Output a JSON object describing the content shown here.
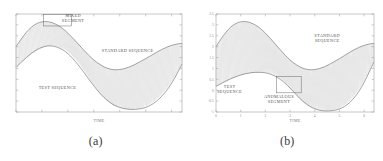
{
  "figure": {
    "panels": [
      {
        "id": "a",
        "caption": "(a)",
        "xlabel": "TIME",
        "annotations": {
          "mixed_segment": "MIXED\nSEGMENT",
          "mixed_segment_line1": "MIXED",
          "mixed_segment_line2": "SEGMENT",
          "standard_sequence": "STANDARD SEQUENCE",
          "test_sequence": "TEST SEQUENCE"
        }
      },
      {
        "id": "b",
        "caption": "(b)",
        "xlabel": "TIME",
        "annotations": {
          "standard_sequence_line1": "STANDARD",
          "standard_sequence_line2": "SEQUENCE",
          "test_sequence_line1": "TEST",
          "test_sequence_line2": "SEQUENCE",
          "anomalous_segment_line1": "ANOMALOUS",
          "anomalous_segment_line2": "SEGMENT"
        }
      }
    ]
  },
  "colors": {
    "background": "#ffffff",
    "axis": "#9a9a9a",
    "curve": "#6e6e6e",
    "connector": "#a8a8a8",
    "text": "#5a5a5a",
    "caption": "#3a3a3a"
  },
  "chart_data": [
    {
      "type": "line",
      "panel": "a",
      "title": "",
      "xlabel": "TIME",
      "ylabel": "",
      "grid": false,
      "legend": "none",
      "xlim": [
        0,
        6.4
      ],
      "ylim": [
        -1.0,
        3.5
      ],
      "xticks": [
        0,
        1,
        2,
        3,
        4,
        5,
        6
      ],
      "xticklabels": [
        "",
        "",
        "",
        "",
        "",
        "",
        ""
      ],
      "yticks": [
        -1,
        -0.5,
        0,
        0.5,
        1,
        1.5,
        2,
        2.5,
        3,
        3.5
      ],
      "yticklabels": [
        "",
        "",
        "",
        "",
        "",
        "",
        "",
        "",
        "",
        ""
      ],
      "description": "Dynamic time warping alignment between a standard sequence and a test sequence; dense vertical connector lines join corresponding points. A boxed region near the first peak marks the MIXED SEGMENT.",
      "series": [
        {
          "name": "STANDARD SEQUENCE",
          "x": [
            0.0,
            0.2,
            0.4,
            0.6,
            0.8,
            1.0,
            1.2,
            1.4,
            1.6,
            1.8,
            2.0,
            2.2,
            2.4,
            2.6,
            2.8,
            3.0,
            3.2,
            3.4,
            3.6,
            3.8,
            4.0,
            4.2,
            4.4,
            4.6,
            4.8,
            5.0,
            5.2,
            5.4,
            5.6,
            5.8,
            6.0,
            6.2,
            6.4
          ],
          "values": [
            2.0,
            2.35,
            2.66,
            2.9,
            3.06,
            3.14,
            3.15,
            3.1,
            2.99,
            2.83,
            2.62,
            2.38,
            2.12,
            1.86,
            1.61,
            1.39,
            1.21,
            1.07,
            0.98,
            0.94,
            0.95,
            1.0,
            1.08,
            1.19,
            1.32,
            1.45,
            1.59,
            1.73,
            1.86,
            1.97,
            2.06,
            2.12,
            2.15
          ]
        },
        {
          "name": "TEST SEQUENCE",
          "x": [
            0.0,
            0.2,
            0.4,
            0.6,
            0.8,
            1.0,
            1.2,
            1.4,
            1.6,
            1.8,
            2.0,
            2.2,
            2.4,
            2.6,
            2.8,
            3.0,
            3.2,
            3.4,
            3.6,
            3.8,
            4.0,
            4.2,
            4.4,
            4.6,
            4.8,
            5.0,
            5.2,
            5.4,
            5.6,
            5.8,
            6.0,
            6.2,
            6.4
          ],
          "values": [
            1.05,
            1.28,
            1.5,
            1.7,
            1.86,
            1.97,
            2.03,
            2.03,
            1.97,
            1.86,
            1.68,
            1.44,
            1.16,
            0.85,
            0.52,
            0.2,
            -0.09,
            -0.34,
            -0.54,
            -0.69,
            -0.79,
            -0.85,
            -0.88,
            -0.88,
            -0.85,
            -0.79,
            -0.68,
            -0.52,
            -0.3,
            -0.02,
            0.32,
            0.74,
            1.2
          ]
        }
      ],
      "annotations": [
        {
          "text": "MIXED SEGMENT",
          "x": 2.2,
          "y": 3.35,
          "boxed": true
        },
        {
          "text": "STANDARD SEQUENCE",
          "x": 4.3,
          "y": 1.75,
          "boxed": false
        },
        {
          "text": "TEST SEQUENCE",
          "x": 1.6,
          "y": 0.05,
          "boxed": false
        }
      ]
    },
    {
      "type": "line",
      "panel": "b",
      "title": "",
      "xlabel": "TIME",
      "ylabel": "",
      "grid": false,
      "legend": "none",
      "xlim": [
        0,
        6.4
      ],
      "ylim": [
        -1.0,
        3.5
      ],
      "xticks": [
        0,
        1,
        2,
        3,
        4,
        5,
        6
      ],
      "xticklabels": [
        "0",
        "1",
        "2",
        "3",
        "4",
        "5",
        "6"
      ],
      "yticks": [
        -1,
        -0.5,
        0,
        0.5,
        1,
        1.5,
        2,
        2.5,
        3,
        3.5
      ],
      "yticklabels": [
        "-1",
        "-0.5",
        "0",
        "0.5",
        "1",
        "1.5",
        "2",
        "2.5",
        "3",
        "3.5"
      ],
      "description": "Dynamic time warping alignment between a standard sequence and a test sequence; dense vertical connector lines join corresponding points. A boxed region near x=3 marks the ANOMALOUS SEGMENT.",
      "series": [
        {
          "name": "STANDARD SEQUENCE",
          "x": [
            0.0,
            0.2,
            0.4,
            0.6,
            0.8,
            1.0,
            1.2,
            1.4,
            1.6,
            1.8,
            2.0,
            2.2,
            2.4,
            2.6,
            2.8,
            3.0,
            3.2,
            3.4,
            3.6,
            3.8,
            4.0,
            4.2,
            4.4,
            4.6,
            4.8,
            5.0,
            5.2,
            5.4,
            5.6,
            5.8,
            6.0,
            6.2,
            6.4
          ],
          "values": [
            2.0,
            2.35,
            2.66,
            2.9,
            3.06,
            3.14,
            3.15,
            3.1,
            2.99,
            2.83,
            2.62,
            2.38,
            2.12,
            1.86,
            1.61,
            1.39,
            1.21,
            1.07,
            0.98,
            0.94,
            0.95,
            1.0,
            1.08,
            1.19,
            1.32,
            1.45,
            1.59,
            1.73,
            1.86,
            1.97,
            2.06,
            2.12,
            2.15
          ]
        },
        {
          "name": "TEST SEQUENCE",
          "x": [
            0.0,
            0.2,
            0.4,
            0.6,
            0.8,
            1.0,
            1.2,
            1.4,
            1.6,
            1.8,
            2.0,
            2.2,
            2.4,
            2.6,
            2.8,
            3.0,
            3.2,
            3.4,
            3.6,
            3.8,
            4.0,
            4.2,
            4.4,
            4.6,
            4.8,
            5.0,
            5.2,
            5.4,
            5.6,
            5.8,
            6.0,
            6.2,
            6.4
          ],
          "values": [
            0.18,
            0.3,
            0.42,
            0.53,
            0.62,
            0.7,
            0.76,
            0.8,
            0.82,
            0.82,
            0.8,
            0.74,
            0.64,
            0.5,
            0.32,
            0.1,
            -0.14,
            -0.38,
            -0.58,
            -0.74,
            -0.85,
            -0.92,
            -0.95,
            -0.95,
            -0.92,
            -0.86,
            -0.75,
            -0.58,
            -0.34,
            -0.03,
            0.36,
            0.82,
            1.3
          ]
        }
      ],
      "annotations": [
        {
          "text": "STANDARD SEQUENCE",
          "x": 4.5,
          "y": 2.45,
          "boxed": false
        },
        {
          "text": "TEST SEQUENCE",
          "x": 0.55,
          "y": 0.1,
          "boxed": false
        },
        {
          "text": "ANOMALOUS SEGMENT",
          "x": 2.55,
          "y": -0.35,
          "boxed": true
        }
      ]
    }
  ]
}
